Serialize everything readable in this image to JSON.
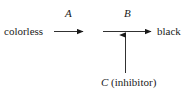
{
  "diagram": {
    "type": "reaction-scheme",
    "background_color": "#ffffff",
    "stroke_color": "#1a1a1a",
    "text_color": "#1a1a1a",
    "nodes": [
      {
        "id": "start",
        "label": "colorless"
      },
      {
        "id": "end",
        "label": "black"
      },
      {
        "id": "inhibitor",
        "label_symbol": "C",
        "label_rest": " (inhibitor)",
        "label": "C (inhibitor)"
      }
    ],
    "edges": [
      {
        "id": "edge-a",
        "label": "A",
        "from": "colorless",
        "to": "intermediate",
        "direction": "right"
      },
      {
        "id": "edge-b",
        "label": "B",
        "from": "intermediate",
        "to": "black",
        "direction": "right"
      },
      {
        "id": "edge-c",
        "label": "",
        "from": "C (inhibitor)",
        "to": "edge-b",
        "direction": "up"
      }
    ]
  }
}
